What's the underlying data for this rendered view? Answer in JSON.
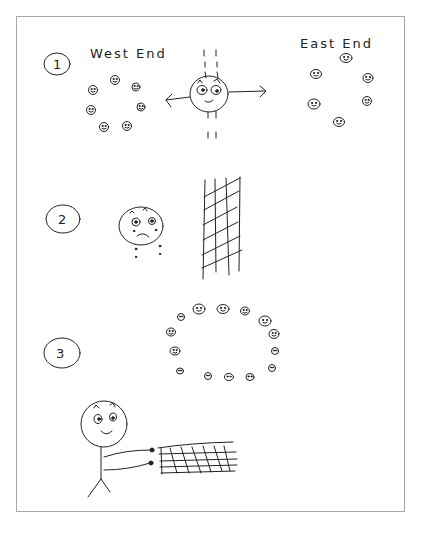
{
  "diagram": {
    "panels": [
      {
        "step": "1",
        "labels": {
          "left": "West End",
          "right": "East End"
        },
        "description": "A central smiling figure with arrows pointing left and right toward two groups of smiling faces"
      },
      {
        "step": "2",
        "description": "A sad, crying face next to a tall grid/net"
      },
      {
        "step": "3",
        "description": "A ring of small faces arranged in a circle"
      },
      {
        "step": "",
        "description": "A smiling stick figure holding a horizontal net/grid with outstretched arms"
      }
    ],
    "colors": {
      "ink": "#222222",
      "frame": "#a8a8a8",
      "background": "#ffffff"
    }
  }
}
